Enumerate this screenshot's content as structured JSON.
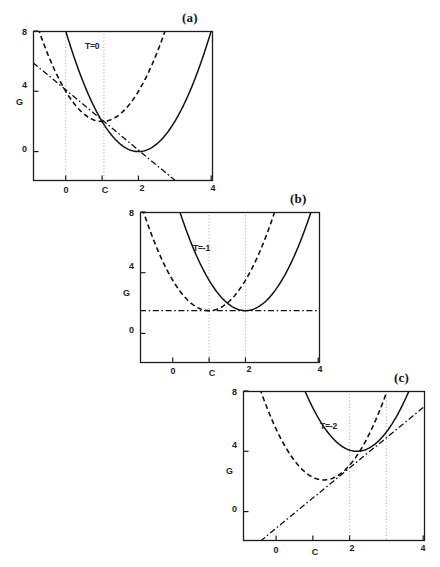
{
  "figure": {
    "axis_label_y": "G",
    "axis_label_x": "C",
    "background": "#ffffff",
    "line_color": "#111111",
    "guide_color": "#9a9a9a"
  },
  "panels": [
    {
      "id": "a",
      "label": "(a)",
      "temperature_label": "T=0",
      "y_label": "G",
      "x_label": "",
      "y_ticks": [
        "8",
        "4",
        "0"
      ],
      "y_tick_values": [
        8,
        4,
        0
      ],
      "x_ticks": [
        "0",
        "C",
        "2",
        "4"
      ],
      "x_tick_values": [
        0,
        1,
        2,
        4
      ],
      "xlim": [
        -0.9,
        4.05
      ],
      "ylim": [
        -1.95,
        8.0
      ],
      "guide_lines_x": [
        0,
        1.05
      ],
      "solid_curve": {
        "vertex_x": 2.0,
        "vertex_y": 0.0,
        "a": 2.0
      },
      "dashed_curve": {
        "vertex_x": 1.0,
        "vertex_y": 2.0,
        "a": 2.0
      },
      "tangent_line": {
        "slope": -2.0,
        "intercept": 4.1
      }
    },
    {
      "id": "b",
      "label": "(b)",
      "temperature_label": "T=-1",
      "y_label": "G",
      "x_label": "C",
      "y_ticks": [
        "8",
        "4",
        "0"
      ],
      "y_tick_values": [
        8,
        4,
        0
      ],
      "x_ticks": [
        "0",
        "C",
        "2",
        "4"
      ],
      "x_tick_values": [
        0,
        1,
        2,
        4
      ],
      "xlim": [
        -0.9,
        4.05
      ],
      "ylim": [
        -1.95,
        8.0
      ],
      "guide_lines_x": [
        1.0,
        2.0
      ],
      "solid_curve": {
        "vertex_x": 2.0,
        "vertex_y": 1.5,
        "a": 2.0
      },
      "dashed_curve": {
        "vertex_x": 1.0,
        "vertex_y": 1.5,
        "a": 2.0
      },
      "tangent_line": {
        "slope": 0.0,
        "intercept": 1.5
      }
    },
    {
      "id": "c",
      "label": "(c)",
      "temperature_label": "T=-2",
      "y_label": "G",
      "x_label": "C",
      "y_ticks": [
        "8",
        "4",
        "0"
      ],
      "y_tick_values": [
        8,
        4,
        0
      ],
      "x_ticks": [
        "0",
        "C",
        "2",
        "4"
      ],
      "x_tick_values": [
        0,
        1,
        2,
        4
      ],
      "xlim": [
        -0.9,
        4.05
      ],
      "ylim": [
        -1.95,
        8.0
      ],
      "guide_lines_x": [
        2.0,
        3.0
      ],
      "solid_curve": {
        "vertex_x": 2.2,
        "vertex_y": 4.0,
        "a": 2.0
      },
      "dashed_curve": {
        "vertex_x": 1.3,
        "vertex_y": 2.1,
        "a": 2.0
      },
      "tangent_line": {
        "slope": 2.0,
        "intercept": -1.1
      }
    }
  ],
  "chart_data": {
    "type": "line",
    "xlabel": "C",
    "ylabel": "G",
    "grid": false,
    "legend": "none",
    "subplots": [
      {
        "panel": "(a)",
        "annotation": "T=0",
        "xlim": [
          -0.9,
          4.05
        ],
        "ylim": [
          -1.95,
          8.0
        ],
        "xticks": [
          0,
          1,
          2,
          4
        ],
        "xticklabels": [
          "0",
          "C",
          "2",
          "4"
        ],
        "yticks": [
          0,
          4,
          8
        ],
        "yticklabels": [
          "0",
          "4",
          "8"
        ],
        "series": [
          {
            "name": "solid-parabola",
            "style": "solid",
            "equation": "G = 2*(C-2)^2 + 0",
            "x": [
              -0.9,
              -0.5,
              0,
              0.5,
              1.0,
              1.5,
              2.0,
              2.5,
              3.0,
              3.5,
              4.0
            ],
            "y": [
              16.8,
              12.5,
              8.0,
              4.5,
              2.0,
              0.5,
              0.0,
              0.5,
              2.0,
              4.5,
              8.0
            ]
          },
          {
            "name": "dashed-parabola",
            "style": "dashed",
            "equation": "G = 2*(C-1)^2 + 2",
            "x": [
              -0.9,
              -0.5,
              0,
              0.5,
              1.0,
              1.5,
              2.0,
              2.5,
              3.0,
              3.5,
              4.0
            ],
            "y": [
              9.2,
              6.5,
              4.0,
              2.5,
              2.0,
              2.5,
              4.0,
              6.5,
              10.0,
              14.5,
              20.0
            ]
          },
          {
            "name": "common-tangent",
            "style": "dash-dot",
            "equation": "G = -2*C + 4.1",
            "x": [
              -0.9,
              2.55
            ],
            "y": [
              5.9,
              -1.0
            ]
          }
        ],
        "guide_lines_x": [
          0.0,
          1.05
        ]
      },
      {
        "panel": "(b)",
        "annotation": "T=-1",
        "xlim": [
          -0.9,
          4.05
        ],
        "ylim": [
          -1.95,
          8.0
        ],
        "xticks": [
          0,
          1,
          2,
          4
        ],
        "xticklabels": [
          "0",
          "C",
          "2",
          "4"
        ],
        "yticks": [
          0,
          4,
          8
        ],
        "yticklabels": [
          "0",
          "4",
          "8"
        ],
        "series": [
          {
            "name": "solid-parabola",
            "style": "solid",
            "equation": "G = 2*(C-2)^2 + 1.5",
            "x": [
              -0.9,
              -0.5,
              0,
              0.5,
              1.0,
              1.5,
              2.0,
              2.5,
              3.0,
              3.5,
              4.0
            ],
            "y": [
              18.3,
              14.0,
              9.5,
              6.0,
              3.5,
              2.0,
              1.5,
              2.0,
              3.5,
              6.0,
              9.5
            ]
          },
          {
            "name": "dashed-parabola",
            "style": "dashed",
            "equation": "G = 2*(C-1)^2 + 1.5",
            "x": [
              -0.9,
              -0.5,
              0,
              0.5,
              1.0,
              1.5,
              2.0,
              2.5,
              3.0,
              3.5,
              4.0
            ],
            "y": [
              8.7,
              6.0,
              3.5,
              2.0,
              1.5,
              2.0,
              3.5,
              6.0,
              9.5,
              14.0,
              19.5
            ]
          },
          {
            "name": "common-tangent",
            "style": "dash-dot",
            "equation": "G = 1.5",
            "x": [
              -0.9,
              4.05
            ],
            "y": [
              1.5,
              1.5
            ]
          }
        ],
        "guide_lines_x": [
          1.0,
          2.0
        ]
      },
      {
        "panel": "(c)",
        "annotation": "T=-2",
        "xlim": [
          -0.9,
          4.05
        ],
        "ylim": [
          -1.95,
          8.0
        ],
        "xticks": [
          0,
          1,
          2,
          4
        ],
        "xticklabels": [
          "0",
          "C",
          "2",
          "4"
        ],
        "yticks": [
          0,
          4,
          8
        ],
        "yticklabels": [
          "0",
          "4",
          "8"
        ],
        "series": [
          {
            "name": "solid-parabola",
            "style": "solid",
            "equation": "G = 2*(C-2.2)^2 + 4.0",
            "x": [
              0.5,
              1.0,
              1.5,
              2.0,
              2.2,
              2.5,
              3.0,
              3.5,
              4.0
            ],
            "y": [
              9.8,
              6.9,
              4.98,
              4.08,
              4.0,
              4.18,
              5.28,
              7.38,
              10.48
            ]
          },
          {
            "name": "dashed-parabola",
            "style": "dashed",
            "equation": "G = 2*(C-1.3)^2 + 2.1",
            "x": [
              -0.9,
              -0.5,
              0,
              0.5,
              1.0,
              1.3,
              1.5,
              2.0,
              2.5,
              3.0,
              3.5
            ],
            "y": [
              11.8,
              8.58,
              5.48,
              3.38,
              2.28,
              2.1,
              2.18,
              3.08,
              4.98,
              7.88,
              11.78
            ]
          },
          {
            "name": "common-tangent",
            "style": "dash-dot",
            "equation": "G = 2*C - 1.1",
            "x": [
              -0.55,
              4.05
            ],
            "y": [
              -2.2,
              7.0
            ]
          }
        ],
        "guide_lines_x": [
          2.0,
          3.0
        ]
      }
    ]
  }
}
